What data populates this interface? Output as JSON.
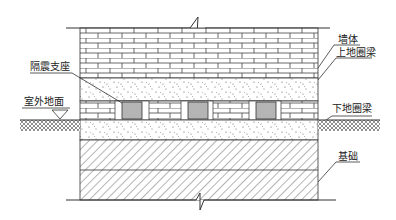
{
  "diagram": {
    "labels": {
      "wall": "墙体",
      "upper_ring_beam": "上地圈梁",
      "isolation_bearing": "隔震支座",
      "outdoor_ground": "室外地面",
      "lower_ring_beam": "下地圈梁",
      "foundation": "基础"
    },
    "layers": [
      {
        "name": "墙体",
        "pattern": "brick"
      },
      {
        "name": "上地圈梁",
        "pattern": "concrete"
      },
      {
        "name": "隔震支座层",
        "pattern": "brick-with-bearings"
      },
      {
        "name": "下地圈梁",
        "pattern": "concrete"
      },
      {
        "name": "基础",
        "pattern": "diagonal-hatch"
      }
    ],
    "bearing_count": 3,
    "colors": {
      "line": "#333333",
      "background": "#ffffff"
    }
  }
}
